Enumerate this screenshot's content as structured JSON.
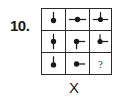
{
  "question": {
    "number": "10.",
    "label": "X"
  },
  "puzzle": {
    "colors": {
      "ink": "#1a1a1a",
      "grid": "#2a2a2a"
    },
    "cells": [
      {
        "row": 1,
        "col": 1,
        "stems": [
          "up"
        ]
      },
      {
        "row": 1,
        "col": 2,
        "stems": [
          "left",
          "right"
        ]
      },
      {
        "row": 1,
        "col": 3,
        "stems": [
          "up",
          "left",
          "right"
        ]
      },
      {
        "row": 2,
        "col": 1,
        "stems": [
          "up",
          "down"
        ]
      },
      {
        "row": 2,
        "col": 2,
        "stems": [
          "right",
          "down"
        ]
      },
      {
        "row": 2,
        "col": 3,
        "stems": [
          "up",
          "right"
        ]
      },
      {
        "row": 3,
        "col": 1,
        "stems": [
          "up"
        ]
      },
      {
        "row": 3,
        "col": 2,
        "stems": [
          "right"
        ]
      },
      {
        "row": 3,
        "col": 3,
        "missing": true,
        "text": "?"
      }
    ]
  }
}
